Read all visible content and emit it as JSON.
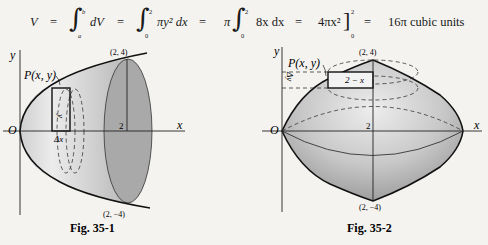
{
  "equation": {
    "V": "V",
    "eq1": "=",
    "int1_upper": "b",
    "int1_lower": "a",
    "int1_body": "dV",
    "eq2": "=",
    "int2_upper": "2",
    "int2_lower": "0",
    "int2_body": "πy² dx",
    "eq3": "=",
    "pi": "π",
    "int3_upper": "2",
    "int3_lower": "0",
    "int3_body": "8x dx",
    "eq4": "=",
    "antideriv": "4πx²",
    "eval_upper": "2",
    "eval_lower": "0",
    "eq5": "=",
    "result": "16π cubic units"
  },
  "figure1": {
    "caption": "Fig. 35-1",
    "y_axis_label": "y",
    "x_axis_label": "x",
    "origin_label": "O",
    "tick_label": "2",
    "point_label": "P(x, y)",
    "top_point": "(2, 4)",
    "bottom_point": "(2, −4)",
    "strip_height_label": "y",
    "strip_width_label": "Δx"
  },
  "figure2": {
    "caption": "Fig. 35-2",
    "y_axis_label": "y",
    "x_axis_label": "x",
    "origin_label": "O",
    "tick_label": "2",
    "point_label": "P(x, y)",
    "top_point": "(2, 4)",
    "bottom_point": "(2, −4)",
    "strip_length_label": "2 − x",
    "strip_width_label": "Δy"
  }
}
